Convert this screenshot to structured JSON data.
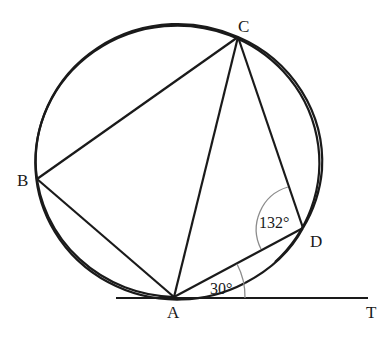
{
  "diagram": {
    "type": "cyclic quadrilateral with tangent",
    "points": {
      "A": {
        "label": "A",
        "x": 174,
        "y": 297
      },
      "B": {
        "label": "B",
        "x": 37,
        "y": 179
      },
      "C": {
        "label": "C",
        "x": 238,
        "y": 37
      },
      "D": {
        "label": "D",
        "x": 303,
        "y": 228
      },
      "T": {
        "label": "T",
        "x": 368,
        "y": 298
      }
    },
    "segments": [
      "AB",
      "BC",
      "CA",
      "CD",
      "DA",
      "tangent AT"
    ],
    "angles": {
      "CDA": {
        "label": "132°"
      },
      "DAT": {
        "label": "30°"
      }
    },
    "colors": {
      "line": "#1a1a1a",
      "arc": "#8c8c8c"
    }
  }
}
